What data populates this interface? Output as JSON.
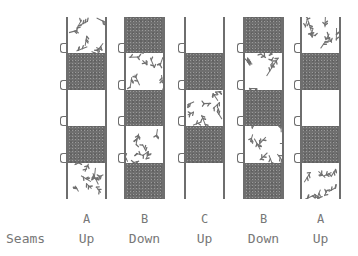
{
  "diagram": {
    "strips": [
      {
        "letter": "A",
        "orientation": "Up",
        "blocks": [
          "floral",
          "dark",
          "white",
          "dark",
          "floral"
        ]
      },
      {
        "letter": "B",
        "orientation": "Down",
        "blocks": [
          "dark",
          "floral",
          "dark",
          "floral",
          "dark"
        ]
      },
      {
        "letter": "C",
        "orientation": "Up",
        "blocks": [
          "white",
          "dark",
          "floral",
          "dark",
          "white"
        ]
      },
      {
        "letter": "B",
        "orientation": "Down",
        "blocks": [
          "dark",
          "floral",
          "dark",
          "floral",
          "dark"
        ]
      },
      {
        "letter": "A",
        "orientation": "Up",
        "blocks": [
          "floral",
          "dark",
          "white",
          "dark",
          "floral"
        ]
      }
    ],
    "row_label": "Seams",
    "colors": {
      "dark": "#6f6f6f",
      "outline": "#6e6e6e",
      "text": "#777777"
    }
  }
}
